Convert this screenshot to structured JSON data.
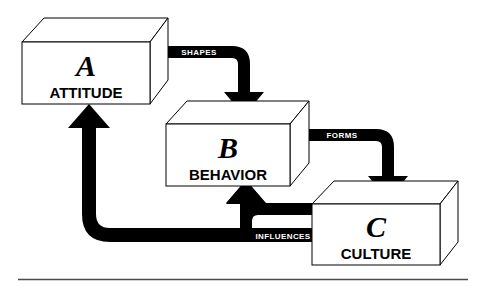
{
  "diagram": {
    "background_color": "#ffffff",
    "shape_color": "#000000",
    "box_fill": "#ffffff",
    "label_text_color": "#ffffff",
    "rule_color": "#4a4a4a",
    "boxes": [
      {
        "id": "A",
        "letter": "A",
        "caption": "ATTITUDE"
      },
      {
        "id": "B",
        "letter": "B",
        "caption": "BEHAVIOR"
      },
      {
        "id": "C",
        "letter": "C",
        "caption": "CULTURE"
      }
    ],
    "arrows": [
      {
        "id": "shapes",
        "label": "SHAPES",
        "from": "A",
        "to": "B"
      },
      {
        "id": "forms",
        "label": "FORMS",
        "from": "B",
        "to": "C"
      },
      {
        "id": "influences-b",
        "label": "INFLUENCES",
        "from": "C",
        "to": "B"
      },
      {
        "id": "influences-a",
        "label": "INFLUENCES",
        "from": "C",
        "to": "A"
      }
    ]
  }
}
